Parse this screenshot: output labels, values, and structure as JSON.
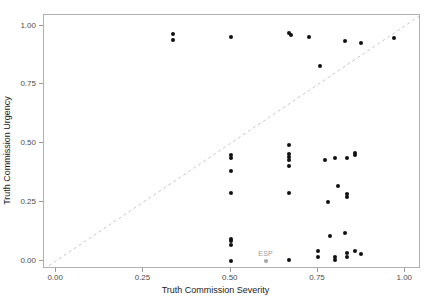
{
  "chart_data": {
    "type": "scatter",
    "title": "",
    "xlabel": "Truth Commission Severity",
    "ylabel": "Truth Commission Urgency",
    "xlim": [
      -0.035,
      1.045
    ],
    "ylim": [
      -0.035,
      1.045
    ],
    "xticks": [
      0.0,
      0.25,
      0.5,
      0.75,
      1.0
    ],
    "xticklabels": [
      "0.00",
      "0.25",
      "0.50",
      "0.75",
      "1.00"
    ],
    "yticks": [
      0.0,
      0.25,
      0.5,
      0.75,
      1.0
    ],
    "yticklabels": [
      "0.00",
      "0.25",
      "0.50",
      "0.75",
      "1.00"
    ],
    "grid": false,
    "legend": "none",
    "point_color": "#111111",
    "highlight_color": "#a6a6a6",
    "reference_line": {
      "type": "dashed-diagonal",
      "from": [
        -0.035,
        -0.035
      ],
      "to": [
        1.045,
        1.045
      ],
      "color": "#c8c8c8",
      "style": "dashed"
    },
    "points": [
      {
        "x": 0.335,
        "y": 0.965
      },
      {
        "x": 0.335,
        "y": 0.94
      },
      {
        "x": 0.5,
        "y": 0.952
      },
      {
        "x": 0.668,
        "y": 0.968
      },
      {
        "x": 0.673,
        "y": 0.958
      },
      {
        "x": 0.723,
        "y": 0.952
      },
      {
        "x": 0.828,
        "y": 0.935
      },
      {
        "x": 0.872,
        "y": 0.925
      },
      {
        "x": 0.968,
        "y": 0.948
      },
      {
        "x": 0.755,
        "y": 0.828
      },
      {
        "x": 0.668,
        "y": 0.492
      },
      {
        "x": 0.668,
        "y": 0.452
      },
      {
        "x": 0.668,
        "y": 0.44
      },
      {
        "x": 0.668,
        "y": 0.428
      },
      {
        "x": 0.668,
        "y": 0.402
      },
      {
        "x": 0.5,
        "y": 0.448
      },
      {
        "x": 0.5,
        "y": 0.435
      },
      {
        "x": 0.5,
        "y": 0.382
      },
      {
        "x": 0.5,
        "y": 0.288
      },
      {
        "x": 0.668,
        "y": 0.288
      },
      {
        "x": 0.77,
        "y": 0.428
      },
      {
        "x": 0.8,
        "y": 0.435
      },
      {
        "x": 0.833,
        "y": 0.438
      },
      {
        "x": 0.855,
        "y": 0.458
      },
      {
        "x": 0.855,
        "y": 0.448
      },
      {
        "x": 0.808,
        "y": 0.32
      },
      {
        "x": 0.833,
        "y": 0.285
      },
      {
        "x": 0.833,
        "y": 0.272
      },
      {
        "x": 0.778,
        "y": 0.252
      },
      {
        "x": 0.785,
        "y": 0.105
      },
      {
        "x": 0.828,
        "y": 0.118
      },
      {
        "x": 0.5,
        "y": 0.092
      },
      {
        "x": 0.5,
        "y": 0.082
      },
      {
        "x": 0.5,
        "y": 0.068
      },
      {
        "x": 0.5,
        "y": 0.0
      },
      {
        "x": 0.668,
        "y": 0.005
      },
      {
        "x": 0.75,
        "y": 0.04
      },
      {
        "x": 0.75,
        "y": 0.018
      },
      {
        "x": 0.8,
        "y": 0.018
      },
      {
        "x": 0.8,
        "y": 0.005
      },
      {
        "x": 0.832,
        "y": 0.035
      },
      {
        "x": 0.832,
        "y": 0.018
      },
      {
        "x": 0.855,
        "y": 0.042
      },
      {
        "x": 0.872,
        "y": 0.028
      }
    ],
    "highlighted_points": [
      {
        "x": 0.6,
        "y": 0.0,
        "label": "ESP"
      }
    ]
  }
}
